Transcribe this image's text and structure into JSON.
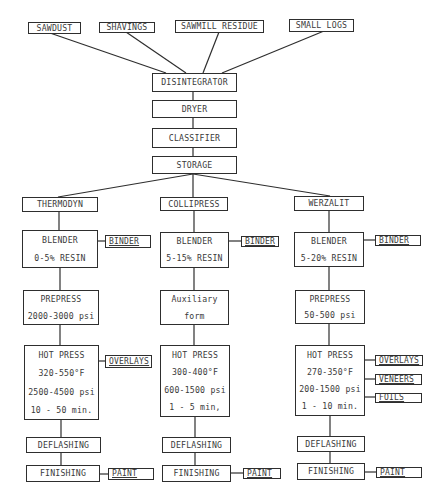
{
  "diagram": {
    "type": "process flow diagram",
    "raw_materials": [
      "SAWDUST",
      "SHAVINGS",
      "SAWMILL RESIDUE",
      "SMALL LOGS"
    ],
    "common_steps": [
      "DISINTEGRATOR",
      "DRYER",
      "CLASSIFIER",
      "STORAGE"
    ],
    "processes": [
      {
        "name": "THERMODYN",
        "blender": {
          "title": "BLENDER",
          "detail": "0-5% RESIN",
          "input": "BINDER"
        },
        "prepress": {
          "title": "PREPRESS",
          "detail": "2000-3000 psi"
        },
        "hot_press": {
          "title": "HOT PRESS",
          "temp": "320-550°F",
          "pressure": "2500-4500 psi",
          "time": "10 - 50 min.",
          "inputs": [
            "OVERLAYS"
          ]
        },
        "deflashing": "DEFLASHING",
        "finishing": {
          "title": "FINISHING",
          "input": "PAINT"
        }
      },
      {
        "name": "COLLIPRESS",
        "blender": {
          "title": "BLENDER",
          "detail": "5-15% RESIN",
          "input": "BINDER"
        },
        "prepress": {
          "title": "Auxiliary",
          "detail": "form"
        },
        "hot_press": {
          "title": "HOT PRESS",
          "temp": "300-400°F",
          "pressure": "600-1500 psi",
          "time": "1 - 5 min,",
          "inputs": []
        },
        "deflashing": "DEFLASHING",
        "finishing": {
          "title": "FINISHING",
          "input": "PAINT"
        }
      },
      {
        "name": "WERZALIT",
        "blender": {
          "title": "BLENDER",
          "detail": "5-20% RESIN",
          "input": "BINDER"
        },
        "prepress": {
          "title": "PREPRESS",
          "detail": "50-500 psi"
        },
        "hot_press": {
          "title": "HOT PRESS",
          "temp": "270-350°F",
          "pressure": "200-1500 psi",
          "time": "1 - 10 min.",
          "inputs": [
            "OVERLAYS",
            "VENEERS",
            "FOILS"
          ]
        },
        "deflashing": "DEFLASHING",
        "finishing": {
          "title": "FINISHING",
          "input": "PAINT"
        }
      }
    ],
    "caption_partial": "(partially cut-off caption text)"
  }
}
